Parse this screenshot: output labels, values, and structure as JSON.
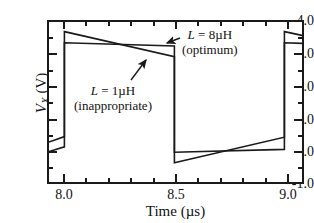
{
  "figure": {
    "background": "#ffffff",
    "line_color": "#1a1a1a"
  },
  "axes": {
    "y_title_var": "V",
    "y_title_sub": "X",
    "y_title_unit": " (V)",
    "x_title": "Time (µs)",
    "y_ticks": [
      "4.0",
      "3.0",
      "2.0",
      "1.0",
      "0.0",
      "-1.0"
    ],
    "x_ticks": [
      "8.0",
      "8.5",
      "9.0"
    ]
  },
  "annotations": {
    "optimum": {
      "line1_var": "L",
      "line1_rest": " = 8µH",
      "line2": "(optimum)"
    },
    "inappropriate": {
      "line1_var": "L",
      "line1_rest": " = 1µH",
      "line2": "(inappropriate)"
    }
  },
  "chart_data": {
    "type": "line",
    "title": "",
    "xlabel": "Time (µs)",
    "ylabel": "V_X (V)",
    "xlim": [
      7.93,
      9.08
    ],
    "ylim": [
      -1.0,
      4.0
    ],
    "grid": false,
    "legend": "annotated-inline",
    "x_major_ticks": [
      8.0,
      8.5,
      9.0
    ],
    "x_minor_tick_step": 0.1,
    "y_major_ticks": [
      4.0,
      3.0,
      2.0,
      1.0,
      0.0,
      -1.0
    ],
    "y_minor_tick_step": 0.5,
    "series": [
      {
        "name": "L = 1µH (inappropriate)",
        "note": "large overshoot / sawtooth ripple",
        "points": [
          [
            7.93,
            -0.05
          ],
          [
            8.0,
            0.1
          ],
          [
            8.0,
            3.7
          ],
          [
            8.5,
            2.92
          ],
          [
            8.5,
            -0.4
          ],
          [
            9.0,
            0.4
          ],
          [
            9.0,
            3.7
          ],
          [
            9.08,
            3.58
          ]
        ]
      },
      {
        "name": "L = 8µH (optimum)",
        "note": "nearly flat top and bottom",
        "points": [
          [
            7.93,
            0.25
          ],
          [
            8.0,
            0.42
          ],
          [
            8.0,
            3.35
          ],
          [
            8.5,
            3.25
          ],
          [
            8.5,
            -0.07
          ],
          [
            9.0,
            0.02
          ],
          [
            9.0,
            3.35
          ],
          [
            9.08,
            3.33
          ]
        ]
      }
    ]
  }
}
